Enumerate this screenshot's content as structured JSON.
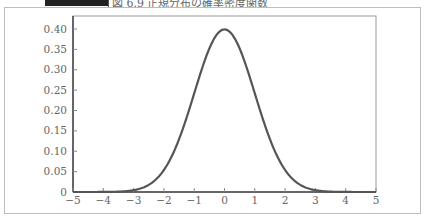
{
  "header": {
    "caption": "図 6.9 正規分布の確率密度関数"
  },
  "chart_data": {
    "type": "line",
    "title": "図 6.9 正規分布の確率密度関数",
    "xlabel": "",
    "ylabel": "",
    "xlim": [
      -5,
      5
    ],
    "ylim": [
      0,
      0.42
    ],
    "grid": false,
    "legend": null,
    "x_ticks": [
      "−5",
      "−4",
      "−3",
      "−2",
      "−1",
      "0",
      "1",
      "2",
      "3",
      "4",
      "5"
    ],
    "y_ticks": [
      "0",
      "0.05",
      "0.10",
      "0.15",
      "0.20",
      "0.25",
      "0.30",
      "0.35",
      "0.40"
    ],
    "series": [
      {
        "name": "standard normal pdf",
        "function": "exp(-x^2/2)/sqrt(2*pi)",
        "x": [
          -5,
          -4,
          -3,
          -2.5,
          -2,
          -1.5,
          -1,
          -0.5,
          0,
          0.5,
          1,
          1.5,
          2,
          2.5,
          3,
          4,
          5
        ],
        "y": [
          0.0,
          0.0001,
          0.0044,
          0.0175,
          0.054,
          0.1295,
          0.242,
          0.3521,
          0.3989,
          0.3521,
          0.242,
          0.1295,
          0.054,
          0.0175,
          0.0044,
          0.0001,
          0.0
        ]
      }
    ],
    "line_color": "#555555"
  }
}
